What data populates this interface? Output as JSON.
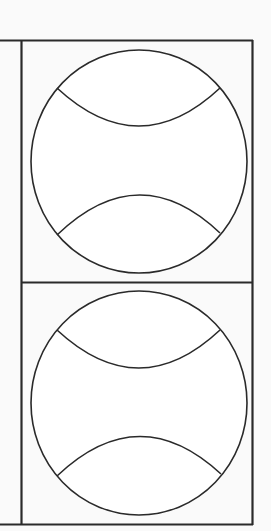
{
  "diagram": {
    "colors": {
      "background": "#fafafa",
      "stroke": "#2a2a2a",
      "fill": "#ffffff"
    },
    "cells": [
      {
        "id": "top",
        "label": "Ball 1"
      },
      {
        "id": "bottom",
        "label": "Ball 2"
      }
    ]
  }
}
